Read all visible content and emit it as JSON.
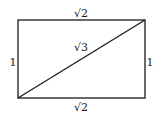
{
  "diagram": {
    "shape": "rectangle",
    "labels": {
      "top": "√2",
      "bottom": "√2",
      "left": "1",
      "right": "1",
      "diagonal": "√3"
    },
    "colors": {
      "stroke": "#1a1a1a",
      "background": "#ffffff"
    }
  }
}
